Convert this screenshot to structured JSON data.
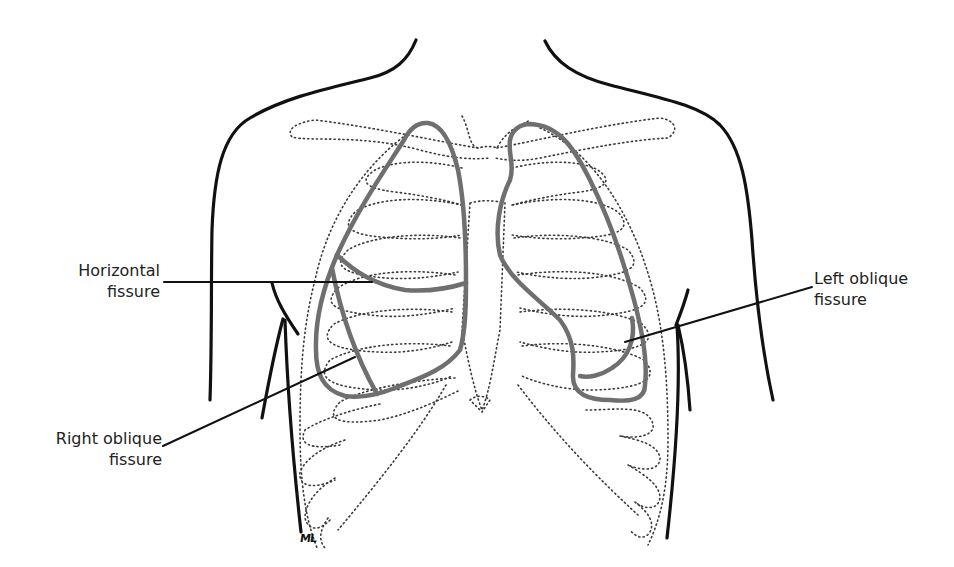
{
  "diagram": {
    "colors": {
      "body_outline": "#111111",
      "rib_cage_dotted": "#3a3a3a",
      "lung_outline": "#6f6f6f",
      "leader_line": "#111111",
      "label_text": "#222222",
      "background": "#ffffff"
    },
    "labels": {
      "horizontal_fissure": {
        "line1": "Horizontal",
        "line2": "fissure"
      },
      "right_oblique_fissure": {
        "line1": "Right oblique",
        "line2": "fissure"
      },
      "left_oblique_fissure": {
        "line1": "Left obliquе",
        "line2": "fissure"
      }
    },
    "signature": "ML"
  }
}
